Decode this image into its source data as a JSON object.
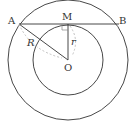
{
  "diagram": {
    "title": "",
    "type": "concentric circles with tangent chord",
    "colors": {
      "stroke": "#333333",
      "dashed": "#bbbbbb",
      "background": "#ffffff"
    },
    "points": {
      "A": {
        "label": "A"
      },
      "B": {
        "label": "B"
      },
      "M": {
        "label": "M"
      },
      "O": {
        "label": "O"
      }
    },
    "segments": {
      "R": {
        "label": "R"
      },
      "r": {
        "label": "r"
      }
    }
  }
}
